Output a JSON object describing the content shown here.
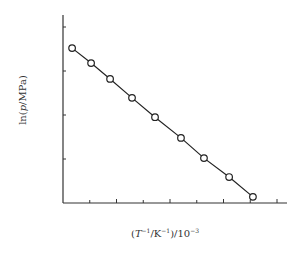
{
  "chart_data": {
    "type": "line",
    "title": "",
    "xlabel": "(T^-1/K^-1)/10^-3",
    "ylabel": "ln(p/MPa)",
    "x_ticks_count": 8,
    "y_ticks_count": 4,
    "tick_labels_shown": false,
    "grid": false,
    "legend": null,
    "marker": "open-circle",
    "xlim": [
      0,
      8.4
    ],
    "ylim": [
      0,
      4.3
    ],
    "series": [
      {
        "name": "ln p vs 1/T",
        "x": [
          0.34,
          1.05,
          1.76,
          2.58,
          3.44,
          4.41,
          5.27,
          6.21,
          7.1
        ],
        "y": [
          3.52,
          3.18,
          2.82,
          2.39,
          1.95,
          1.48,
          1.02,
          0.59,
          0.14
        ]
      }
    ]
  },
  "labels": {
    "y_pre": "ln(",
    "y_var": "p",
    "y_post": "/MPa)",
    "x_open": "(",
    "x_T": "T",
    "x_exp1": "−1",
    "x_mid": "/K",
    "x_exp2": "−1",
    "x_close": ")/10",
    "x_exp3": "−3"
  },
  "colors": {
    "axis": "#333333",
    "line": "#222222",
    "marker_fill": "#ffffff"
  }
}
